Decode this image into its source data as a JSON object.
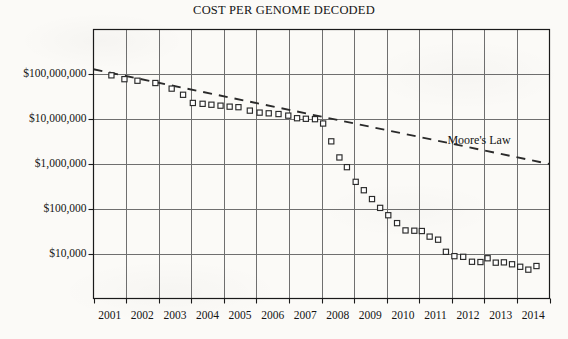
{
  "chart_data": {
    "type": "scatter",
    "title": "COST PER GENOME DECODED",
    "xlabel": "",
    "ylabel": "",
    "scale": "log-y",
    "grid": true,
    "legend_position": "inline-annotation",
    "xlim": [
      2001,
      2015
    ],
    "ylim": [
      1000,
      1000000000
    ],
    "categories": [
      "2001",
      "2002",
      "2003",
      "2004",
      "2005",
      "2006",
      "2007",
      "2008",
      "2009",
      "2010",
      "2011",
      "2012",
      "2013",
      "2014"
    ],
    "ytick_labels": [
      "$100,000,000",
      "$10,000,000",
      "$1,000,000",
      "$100,000",
      "$10,000"
    ],
    "ytick_values": [
      100000000,
      10000000,
      1000000,
      100000,
      10000
    ],
    "annotations": [
      {
        "text": "Moore's Law",
        "x": 2012.05,
        "y": 3100000
      }
    ],
    "series": [
      {
        "name": "Cost per genome",
        "marker": "open-square",
        "points": [
          {
            "x": 2001.55,
            "y": 95000000
          },
          {
            "x": 2001.95,
            "y": 78000000
          },
          {
            "x": 2002.35,
            "y": 72000000
          },
          {
            "x": 2002.9,
            "y": 64000000
          },
          {
            "x": 2003.4,
            "y": 48000000
          },
          {
            "x": 2003.75,
            "y": 35000000
          },
          {
            "x": 2004.05,
            "y": 23000000
          },
          {
            "x": 2004.35,
            "y": 22000000
          },
          {
            "x": 2004.62,
            "y": 21000000
          },
          {
            "x": 2004.9,
            "y": 20000000
          },
          {
            "x": 2005.18,
            "y": 19000000
          },
          {
            "x": 2005.45,
            "y": 18500000
          },
          {
            "x": 2005.8,
            "y": 15500000
          },
          {
            "x": 2006.1,
            "y": 14000000
          },
          {
            "x": 2006.38,
            "y": 13500000
          },
          {
            "x": 2006.68,
            "y": 13000000
          },
          {
            "x": 2006.98,
            "y": 12000000
          },
          {
            "x": 2007.25,
            "y": 10500000
          },
          {
            "x": 2007.52,
            "y": 10200000
          },
          {
            "x": 2007.8,
            "y": 10000000
          },
          {
            "x": 2008.05,
            "y": 8000000
          },
          {
            "x": 2008.3,
            "y": 3200000
          },
          {
            "x": 2008.55,
            "y": 1400000
          },
          {
            "x": 2008.78,
            "y": 850000
          },
          {
            "x": 2009.05,
            "y": 400000
          },
          {
            "x": 2009.3,
            "y": 260000
          },
          {
            "x": 2009.55,
            "y": 165000
          },
          {
            "x": 2009.8,
            "y": 105000
          },
          {
            "x": 2010.05,
            "y": 72000
          },
          {
            "x": 2010.32,
            "y": 48000
          },
          {
            "x": 2010.58,
            "y": 33000
          },
          {
            "x": 2010.85,
            "y": 32500
          },
          {
            "x": 2011.08,
            "y": 32000
          },
          {
            "x": 2011.32,
            "y": 24000
          },
          {
            "x": 2011.58,
            "y": 20500
          },
          {
            "x": 2011.82,
            "y": 11000
          },
          {
            "x": 2012.08,
            "y": 8800
          },
          {
            "x": 2012.35,
            "y": 8500
          },
          {
            "x": 2012.62,
            "y": 6600
          },
          {
            "x": 2012.88,
            "y": 6500
          },
          {
            "x": 2013.1,
            "y": 7900
          },
          {
            "x": 2013.35,
            "y": 6300
          },
          {
            "x": 2013.6,
            "y": 6400
          },
          {
            "x": 2013.85,
            "y": 5800
          },
          {
            "x": 2014.1,
            "y": 5100
          },
          {
            "x": 2014.35,
            "y": 4400
          },
          {
            "x": 2014.6,
            "y": 5300
          }
        ]
      },
      {
        "name": "Moore's Law",
        "style": "dashed-line",
        "points": [
          {
            "x": 2001.0,
            "y": 130000000
          },
          {
            "x": 2015.0,
            "y": 1000000
          }
        ]
      }
    ]
  },
  "colors": {
    "ink": "#141414",
    "grid": "#6f6f6f",
    "axis": "#1a1a1a",
    "marker_stroke": "#2a2a2a",
    "marker_fill": "#ffffff",
    "page": "#fbfaf7"
  }
}
